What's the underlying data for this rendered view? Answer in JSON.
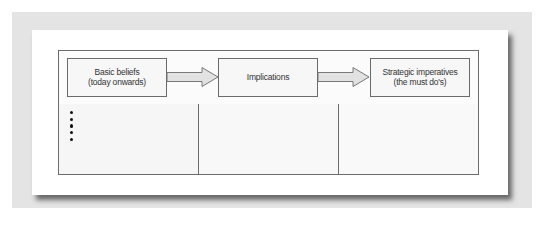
{
  "diagram": {
    "type": "flow-table",
    "boxes": [
      {
        "line1": "Basic beliefs",
        "line2": "(today onwards)"
      },
      {
        "line1": "Implications",
        "line2": ""
      },
      {
        "line1": "Strategic imperatives",
        "line2": "(the must do's)"
      }
    ],
    "arrows": [
      {
        "from": "Basic beliefs (today onwards)",
        "to": "Implications"
      },
      {
        "from": "Implications",
        "to": "Strategic imperatives (the must do's)"
      }
    ],
    "columns": [
      {
        "bullet_count": 5
      },
      {
        "bullet_count": 0
      },
      {
        "bullet_count": 0
      }
    ]
  },
  "colors": {
    "backdrop": "#e4e4e4",
    "card": "#ffffff",
    "border": "#6b6b6b",
    "box_fill": "#f7f7f7",
    "arrow_fill": "#e2e2e2",
    "bullet": "#111111"
  }
}
